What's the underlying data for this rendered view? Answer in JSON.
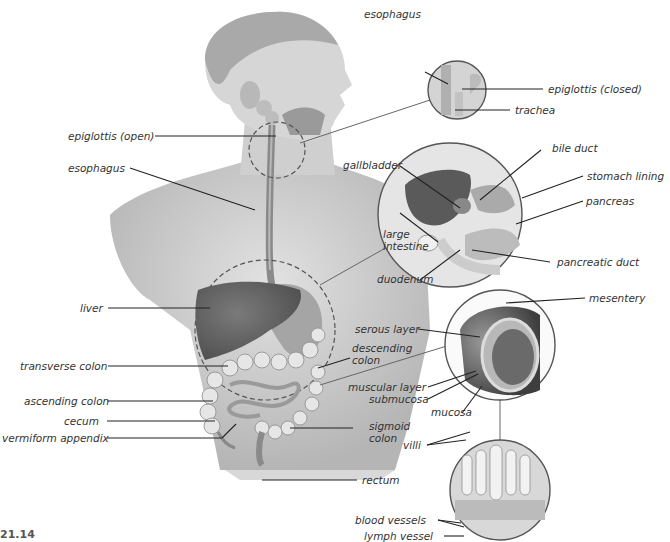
{
  "figure": {
    "number_partial": "21.14"
  },
  "labels": {
    "esophagus_inset": "esophagus",
    "epiglottis_closed": "epiglottis (closed)",
    "trachea": "trachea",
    "epiglottis_open": "epiglottis (open)",
    "esophagus": "esophagus",
    "bile_duct": "bile duct",
    "gallbladder": "gallbladder",
    "stomach_lining": "stomach lining",
    "pancreas": "pancreas",
    "large_intestine_1": "large",
    "large_intestine_2": "intestine",
    "pancreatic_duct": "pancreatic duct",
    "duodenum": "duodenum",
    "mesentery": "mesentery",
    "liver": "liver",
    "serous_layer": "serous layer",
    "transverse_colon": "transverse colon",
    "descending_colon_1": "descending",
    "descending_colon_2": "colon",
    "muscular_layer": "muscular layer",
    "ascending_colon": "ascending colon",
    "submucosa": "submucosa",
    "mucosa": "mucosa",
    "cecum": "cecum",
    "vermiform_appendix": "vermiform appendix",
    "sigmoid_colon_1": "sigmoid",
    "sigmoid_colon_2": "colon",
    "villi": "villi",
    "rectum": "rectum",
    "blood_vessels": "blood vessels",
    "lymph_vessel": "lymph vessel"
  },
  "colors": {
    "label_text": "#333333",
    "leader_line": "#222222",
    "skin": "#c9c9c9",
    "organ_dark": "#6e6e6e",
    "inset_border": "#555555"
  }
}
